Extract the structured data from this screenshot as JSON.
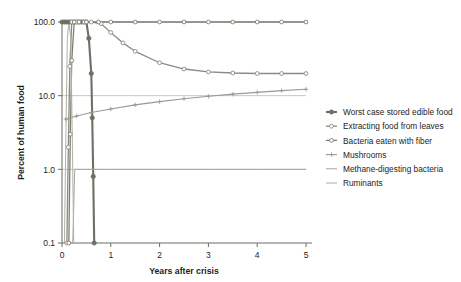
{
  "chart_data": {
    "type": "line",
    "title": "",
    "xlabel": "Years after crisis",
    "ylabel": "Percent of human food",
    "xlim": [
      0,
      5
    ],
    "ylim": [
      0.1,
      100
    ],
    "yscale": "log",
    "grid": true,
    "legend_position": "right",
    "xticks": [
      "0",
      "1",
      "2",
      "3",
      "4",
      "5"
    ],
    "xtick_values": [
      0,
      1,
      2,
      3,
      4,
      5
    ],
    "yticks": [
      "100.0",
      "10.0",
      "1.0",
      "0.1"
    ],
    "ytick_values": [
      100,
      10,
      1,
      0.1
    ],
    "series": [
      {
        "name": "Worst case stored edible food",
        "color": "#6f6f66",
        "width": 2.1,
        "marker": "circle-filled",
        "x": [
          0.0,
          0.05,
          0.1,
          0.15,
          0.2,
          0.25,
          0.3,
          0.35,
          0.4,
          0.45,
          0.5,
          0.55,
          0.6,
          0.62,
          0.64,
          0.66
        ],
        "values": [
          100,
          100,
          100,
          100,
          100,
          100,
          100,
          100,
          100,
          100,
          100,
          60,
          20,
          5,
          0.8,
          0.1
        ]
      },
      {
        "name": "Extracting food from leaves",
        "color": "#8a8a80",
        "width": 1.3,
        "marker": "circle-open",
        "x": [
          0.1,
          0.13,
          0.16,
          0.2,
          0.3,
          0.45,
          0.6,
          0.8,
          1.0,
          1.25,
          1.5,
          2.0,
          2.5,
          3.0,
          3.5,
          4.0,
          4.5,
          5.0
        ],
        "values": [
          0.1,
          2.0,
          25,
          100,
          100,
          100,
          100,
          95,
          72,
          52,
          40,
          28,
          23,
          21,
          20.3,
          20,
          20,
          20
        ]
      },
      {
        "name": "Bacteria eaten with fiber",
        "color": "#7d7d73",
        "width": 1.3,
        "marker": "circle-open",
        "x": [
          0.14,
          0.17,
          0.2,
          0.25,
          0.35,
          0.5,
          0.75,
          1.0,
          1.5,
          2.0,
          2.5,
          3.0,
          3.5,
          4.0,
          4.5,
          5.0
        ],
        "values": [
          0.1,
          3.0,
          30,
          100,
          100,
          100,
          100,
          100,
          100,
          100,
          100,
          100,
          100,
          100,
          100,
          100
        ]
      },
      {
        "name": "Mushrooms",
        "color": "#9a9a90",
        "width": 1.1,
        "marker": "plus",
        "x": [
          0.08,
          0.3,
          0.6,
          1.0,
          1.5,
          2.0,
          2.5,
          3.0,
          3.5,
          4.0,
          4.5,
          5.0
        ],
        "values": [
          4.8,
          5.3,
          5.9,
          6.6,
          7.5,
          8.3,
          9.1,
          9.8,
          10.5,
          11.1,
          11.7,
          12.2
        ]
      },
      {
        "name": "Methane-digesting bacteria",
        "color": "#a6a69c",
        "width": 1.0,
        "marker": "none",
        "x": [
          0.22,
          0.24,
          0.26,
          0.3,
          0.5,
          1.0,
          2.0,
          3.0,
          4.0,
          5.0
        ],
        "values": [
          0.1,
          0.3,
          1.0,
          1.0,
          1.0,
          1.0,
          1.0,
          1.0,
          1.0,
          1.0
        ]
      },
      {
        "name": "Ruminants",
        "color": "#b0b0a6",
        "width": 1.0,
        "marker": "none",
        "x": [
          0.05,
          0.08,
          0.11,
          0.14,
          0.18,
          0.21,
          0.24
        ],
        "values": [
          0.1,
          3.0,
          60,
          100,
          60,
          3.0,
          0.1
        ]
      }
    ]
  }
}
